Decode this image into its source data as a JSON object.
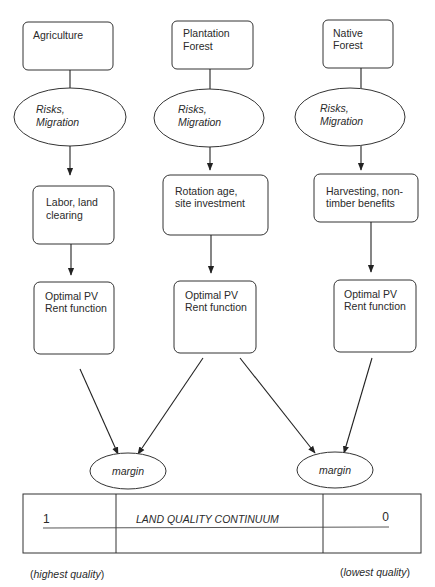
{
  "columns": [
    {
      "source": {
        "lines": [
          "Agriculture"
        ]
      },
      "factor": {
        "lines": [
          "Risks,",
          "Migration"
        ]
      },
      "decision": {
        "lines": [
          "Labor, land",
          "clearing"
        ]
      },
      "result": {
        "lines": [
          "Optimal PV",
          "Rent function"
        ]
      }
    },
    {
      "source": {
        "lines": [
          "Plantation",
          "Forest"
        ]
      },
      "factor": {
        "lines": [
          "Risks,",
          "Migration"
        ]
      },
      "decision": {
        "lines": [
          "Rotation age,",
          "site investment"
        ]
      },
      "result": {
        "lines": [
          "Optimal PV",
          "Rent function"
        ]
      }
    },
    {
      "source": {
        "lines": [
          "Native",
          "Forest"
        ]
      },
      "factor": {
        "lines": [
          "Risks,",
          "Migration"
        ]
      },
      "decision": {
        "lines": [
          "Harvesting, non-",
          "timber benefits"
        ]
      },
      "result": {
        "lines": [
          "Optimal PV",
          "Rent function"
        ]
      }
    }
  ],
  "margins": [
    {
      "label": "margin"
    },
    {
      "label": "margin"
    }
  ],
  "continuum": {
    "left_value": "1",
    "title": "LAND QUALITY CONTINUUM",
    "right_value": "0",
    "left_caption_open": "(",
    "left_caption_text": "highest quality",
    "left_caption_close": ")",
    "right_caption_open": "(",
    "right_caption_text": "lowest quality",
    "right_caption_close": ")"
  }
}
